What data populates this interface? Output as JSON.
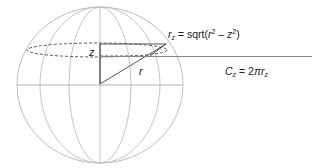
{
  "diagram": {
    "labels": {
      "z": "z",
      "r": "r",
      "rz_formula": {
        "var": "r",
        "sub": "z",
        "eq": " = sqrt(",
        "r": "r",
        "sup1": "2",
        "minus": " – ",
        "z": "z",
        "sup2": "2",
        "close": ")"
      },
      "cz_formula": {
        "var": "C",
        "sub": "z",
        "eq": " = 2",
        "pi": "π",
        "r": "r",
        "sub2": "z"
      }
    },
    "colors": {
      "grid": "#b8b8b8",
      "lines": "#555555",
      "dashed": "#555555",
      "text": "#222222"
    }
  }
}
